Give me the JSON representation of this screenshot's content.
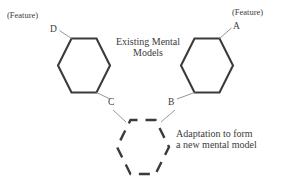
{
  "diagram": {
    "title_caption": "Existing Mental\nModels",
    "labels": {
      "feature_left": "(Feature)",
      "feature_right": "(Feature)",
      "vertex_d": "D",
      "vertex_a": "A",
      "vertex_c": "C",
      "vertex_b": "B"
    },
    "captions": {
      "existing_line1": "Existing Mental",
      "existing_line2": "Models",
      "adaptation_line1": "Adaptation to form",
      "adaptation_line2": "a new mental model"
    },
    "colors": {
      "stroke": "#3b3b3b",
      "thin_stroke": "#8a8a8a",
      "background": "#ffffff",
      "text": "#3b3b3b"
    },
    "shapes": {
      "left_hexagon": {
        "name": "existing-mental-model-left",
        "style": "solid",
        "cx": 84,
        "cy": 65.5,
        "rx": 27,
        "ry": 28
      },
      "right_hexagon": {
        "name": "existing-mental-model-right",
        "style": "solid",
        "cx": 207,
        "cy": 65.5,
        "rx": 27,
        "ry": 28
      },
      "dashed_hexagon": {
        "name": "new-mental-model",
        "style": "dashed",
        "cx": 143,
        "cy": 147,
        "rx": 27,
        "ry": 28
      }
    },
    "connectors": [
      {
        "name": "connector-d-to-left-hexagon",
        "from": "D",
        "to": "left_hexagon_top_left"
      },
      {
        "name": "connector-a-to-right-hexagon",
        "from": "A",
        "to": "right_hexagon_top_right"
      },
      {
        "name": "connector-left-hexagon-to-c",
        "from": "left_hexagon_bottom_right",
        "to": "C"
      },
      {
        "name": "connector-right-hexagon-to-b",
        "from": "right_hexagon_bottom_left",
        "to": "B"
      },
      {
        "name": "connector-c-to-new-model",
        "from": "C",
        "to": "new_hexagon_top_left"
      },
      {
        "name": "connector-b-to-new-model",
        "from": "B",
        "to": "new_hexagon_top_right"
      }
    ]
  }
}
